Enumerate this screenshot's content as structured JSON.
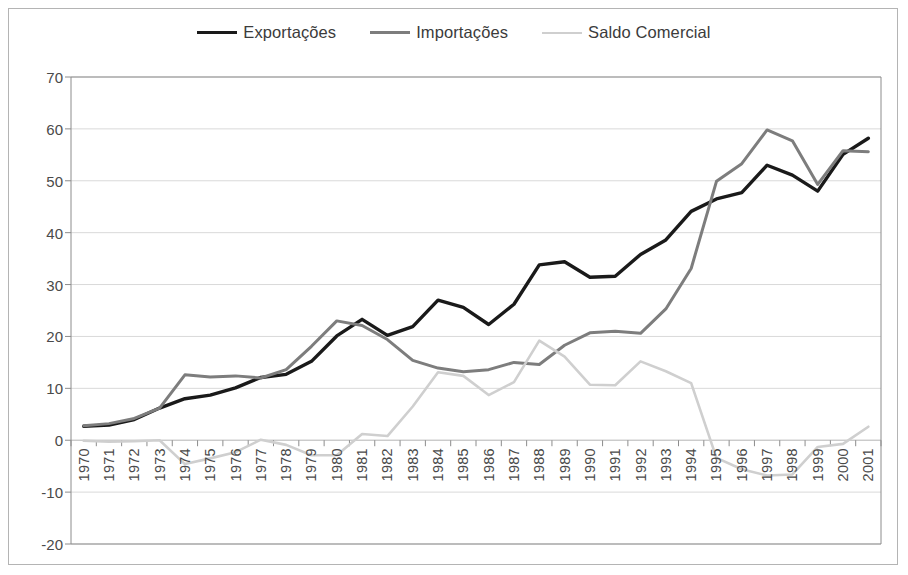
{
  "legend": {
    "position": "top-center",
    "items": [
      {
        "label": "Exportações",
        "color": "#1a1a1a",
        "width": 3.4
      },
      {
        "label": "Importações",
        "color": "#7d7d7d",
        "width": 3.0
      },
      {
        "label": "Saldo Comercial",
        "color": "#cfcfcf",
        "width": 2.6
      }
    ]
  },
  "axes": {
    "y_ticks": [
      70,
      60,
      50,
      40,
      30,
      20,
      10,
      0,
      -10,
      -20
    ],
    "y_tick_labels": [
      "70",
      "60",
      "50",
      "40",
      "30",
      "20",
      "10",
      "0",
      "-10",
      "-20"
    ],
    "ylim": [
      -20,
      70
    ],
    "grid": true,
    "grid_color": "#d9d9d9",
    "axis_color": "#8c8c8c"
  },
  "chart_data": {
    "type": "line",
    "title": "",
    "xlabel": "",
    "ylabel": "",
    "ylim": [
      -20,
      70
    ],
    "grid": true,
    "legend_position": "top-center",
    "categories": [
      "1970",
      "1971",
      "1972",
      "1973",
      "1974",
      "1975",
      "1976",
      "1977",
      "1978",
      "1979",
      "1980",
      "1981",
      "1982",
      "1983",
      "1984",
      "1985",
      "1986",
      "1987",
      "1988",
      "1989",
      "1990",
      "1991",
      "1992",
      "1993",
      "1994",
      "1995",
      "1996",
      "1997",
      "1998",
      "1999",
      "2000",
      "2001"
    ],
    "series": [
      {
        "name": "Exportações",
        "color": "#1a1a1a",
        "values": [
          2.7,
          2.9,
          4.0,
          6.2,
          8.0,
          8.7,
          10.1,
          12.1,
          12.7,
          15.2,
          20.1,
          23.3,
          20.2,
          21.9,
          27.0,
          25.6,
          22.3,
          26.2,
          33.8,
          34.4,
          31.4,
          31.6,
          35.8,
          38.6,
          44.1,
          46.5,
          47.7,
          53.0,
          51.1,
          48.0,
          55.1,
          58.2
        ]
      },
      {
        "name": "Importações",
        "color": "#7d7d7d",
        "values": [
          2.8,
          3.2,
          4.2,
          6.2,
          12.6,
          12.2,
          12.4,
          12.0,
          13.6,
          18.1,
          23.0,
          22.1,
          19.4,
          15.4,
          13.9,
          13.2,
          13.6,
          15.0,
          14.6,
          18.3,
          20.7,
          21.0,
          20.6,
          25.3,
          33.1,
          49.9,
          53.3,
          59.8,
          57.7,
          49.3,
          55.8,
          55.6
        ]
      },
      {
        "name": "Saldo Comercial",
        "color": "#cfcfcf",
        "values": [
          -0.1,
          -0.3,
          -0.2,
          0.0,
          -4.6,
          -3.5,
          -2.3,
          0.1,
          -0.9,
          -2.9,
          -2.9,
          1.2,
          0.8,
          6.5,
          13.1,
          12.4,
          8.7,
          11.2,
          19.2,
          16.1,
          10.7,
          10.6,
          15.2,
          13.3,
          11.0,
          -3.4,
          -5.6,
          -6.8,
          -6.6,
          -1.3,
          -0.7,
          2.6
        ]
      }
    ]
  }
}
